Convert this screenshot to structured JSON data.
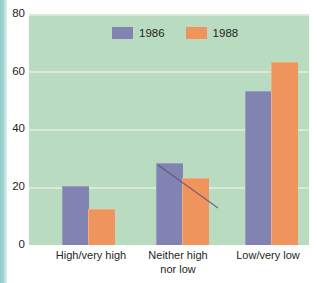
{
  "chart_data": {
    "type": "bar",
    "title": "",
    "xlabel": "",
    "ylabel": "",
    "categories": [
      "High/very high",
      "Neither high\nnor low",
      "Low/very low"
    ],
    "series": [
      {
        "name": "1986",
        "color": "#8183b3",
        "values": [
          20,
          28,
          53
        ]
      },
      {
        "name": "1988",
        "color": "#f0945e",
        "values": [
          12,
          23,
          63
        ]
      }
    ],
    "yticks": [
      0,
      20,
      40,
      60,
      80
    ],
    "ylim": [
      0,
      80
    ],
    "grid": true,
    "legend_position": "top-center",
    "plot_background": "#b9dcc1"
  },
  "legend": {
    "items": [
      {
        "label": "1986"
      },
      {
        "label": "1988"
      }
    ]
  },
  "axis": {
    "yticks": [
      {
        "label": "80"
      },
      {
        "label": "60"
      },
      {
        "label": "40"
      },
      {
        "label": "20"
      },
      {
        "label": "0"
      }
    ],
    "xticks": [
      {
        "label": "High/very high"
      },
      {
        "label": "Neither high\nnor low"
      },
      {
        "label": "Low/very low"
      }
    ]
  }
}
